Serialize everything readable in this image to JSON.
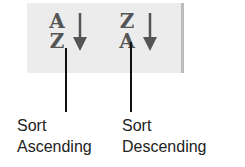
{
  "toolbar": {
    "buttons": [
      {
        "id": "sort-ascending",
        "icon": "sort-ascending-icon",
        "letters": [
          "A",
          "Z"
        ],
        "arrow": "down"
      },
      {
        "id": "sort-descending",
        "icon": "sort-descending-icon",
        "letters": [
          "Z",
          "A"
        ],
        "arrow": "down"
      }
    ]
  },
  "callouts": [
    {
      "line1": "Sort",
      "line2": "Ascending"
    },
    {
      "line1": "Sort",
      "line2": "Descending"
    }
  ],
  "colors": {
    "toolbar_bg": "#ececec",
    "toolbar_edge": "#bdbdbd",
    "icon": "#555555",
    "text": "#222222"
  }
}
